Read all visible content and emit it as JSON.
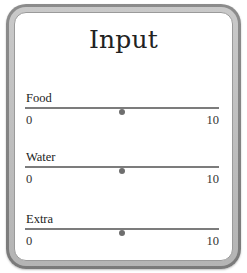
{
  "panel": {
    "title": "Input"
  },
  "sliders": [
    {
      "label": "Food",
      "min": "0",
      "max": "10",
      "value": 5,
      "min_num": 0,
      "max_num": 10
    },
    {
      "label": "Water",
      "min": "0",
      "max": "10",
      "value": 5,
      "min_num": 0,
      "max_num": 10
    },
    {
      "label": "Extra",
      "min": "0",
      "max": "10",
      "value": 5,
      "min_num": 0,
      "max_num": 10
    }
  ],
  "colors": {
    "frame_outer": "#8c8c8c",
    "frame_inner": "#c0c0c0",
    "panel_bg": "#ffffff",
    "track": "#7c7c7c",
    "thumb": "#6e6e6e",
    "text": "#222222"
  }
}
